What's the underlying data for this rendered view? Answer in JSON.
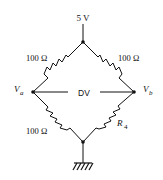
{
  "diagram": {
    "type": "wheatstone-bridge",
    "supply_label": "5 V",
    "resistors": {
      "top_left": "100 Ω",
      "top_right": "100 Ω",
      "bottom_left": "100 Ω",
      "bottom_right_main": "R",
      "bottom_right_sub": "4"
    },
    "nodes": {
      "left_main": "V",
      "left_sub": "a",
      "right_main": "V",
      "right_sub": "b"
    },
    "differential_label": "DV",
    "colors": {
      "line": "#111111",
      "background": "#ffffff"
    }
  }
}
